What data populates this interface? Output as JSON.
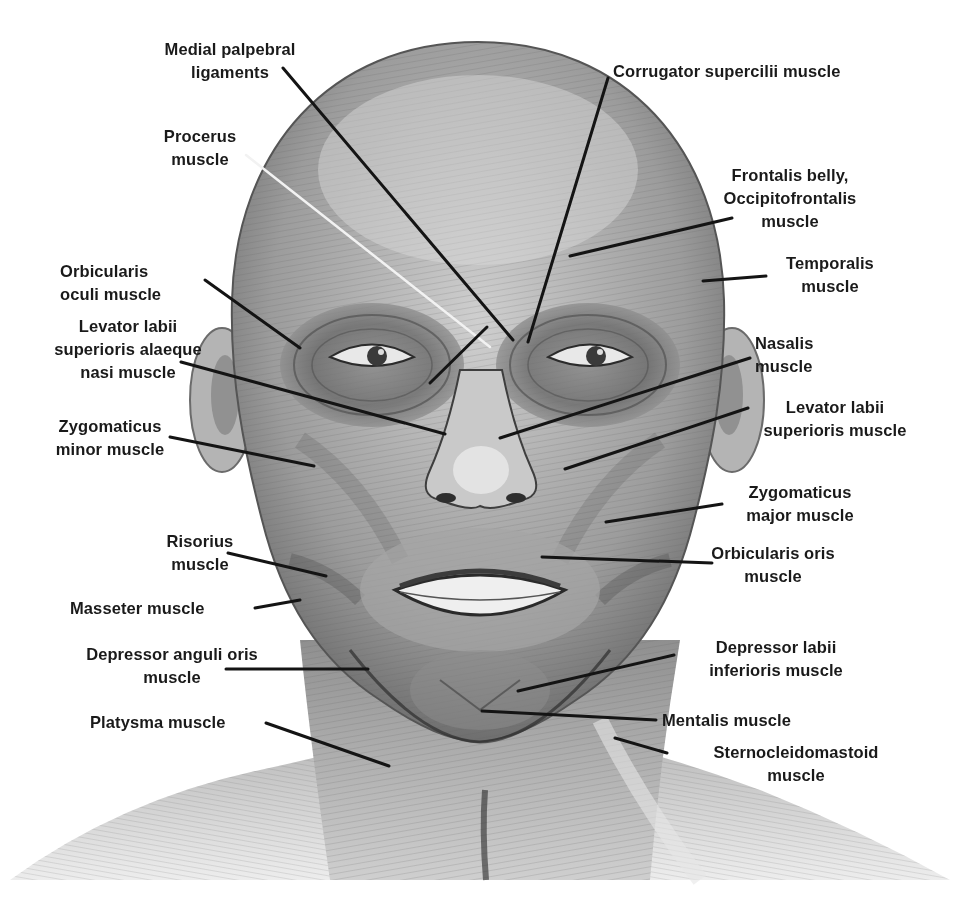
{
  "figure": {
    "colors": {
      "background": "#ffffff",
      "text": "#1a1a1a",
      "leader_line": "#141414",
      "leader_line_light": "#f2f2f2",
      "skin_mid": "#a9a9a9",
      "skin_light": "#dcdcdc",
      "skin_dark": "#555555"
    }
  },
  "labels": [
    {
      "id": "medial-palpebral-ligaments",
      "text": "Medial palpebral\nligaments",
      "x": 145,
      "y": 38,
      "w": 170,
      "align": "center"
    },
    {
      "id": "corrugator-supercilii-muscle",
      "text": "Corrugator supercilii muscle",
      "x": 613,
      "y": 60,
      "w": 320,
      "align": "right"
    },
    {
      "id": "procerus-muscle",
      "text": "Procerus\nmuscle",
      "x": 150,
      "y": 125,
      "w": 100,
      "align": "center"
    },
    {
      "id": "frontalis-belly-occipitofrontalis-muscle",
      "text": "Frontalis belly,\nOccipitofrontalis\nmuscle",
      "x": 700,
      "y": 164,
      "w": 180,
      "align": "center"
    },
    {
      "id": "temporalis-muscle",
      "text": "Temporalis\nmuscle",
      "x": 760,
      "y": 252,
      "w": 140,
      "align": "center"
    },
    {
      "id": "orbicularis-oculi-muscle",
      "text": "Orbicularis\noculi muscle",
      "x": 60,
      "y": 260,
      "w": 150,
      "align": "right"
    },
    {
      "id": "levator-labii-superioris-alaeque-nasi-muscle",
      "text": "Levator labii\nsuperioris alaeque\nnasi muscle",
      "x": 28,
      "y": 315,
      "w": 200,
      "align": "center"
    },
    {
      "id": "nasalis-muscle",
      "text": "Nasalis\nmuscle",
      "x": 755,
      "y": 332,
      "w": 100,
      "align": "right"
    },
    {
      "id": "levator-labii-superioris-muscle",
      "text": "Levator labii\nsuperioris muscle",
      "x": 735,
      "y": 396,
      "w": 200,
      "align": "center"
    },
    {
      "id": "zygomaticus-minor-muscle",
      "text": "Zygomaticus\nminor muscle",
      "x": 40,
      "y": 415,
      "w": 140,
      "align": "center"
    },
    {
      "id": "zygomaticus-major-muscle",
      "text": "Zygomaticus\nmajor muscle",
      "x": 720,
      "y": 481,
      "w": 160,
      "align": "center"
    },
    {
      "id": "risorius-muscle",
      "text": "Risorius\nmuscle",
      "x": 150,
      "y": 530,
      "w": 100,
      "align": "center"
    },
    {
      "id": "orbicularis-oris-muscle",
      "text": "Orbicularis oris\nmuscle",
      "x": 673,
      "y": 542,
      "w": 200,
      "align": "center"
    },
    {
      "id": "masseter-muscle",
      "text": "Masseter muscle",
      "x": 70,
      "y": 597,
      "w": 180,
      "align": "right"
    },
    {
      "id": "depressor-labii-inferioris-muscle",
      "text": "Depressor labii\ninferioris muscle",
      "x": 676,
      "y": 636,
      "w": 200,
      "align": "center"
    },
    {
      "id": "depressor-anguli-oris-muscle",
      "text": "Depressor anguli oris\nmuscle",
      "x": 62,
      "y": 643,
      "w": 220,
      "align": "center"
    },
    {
      "id": "platysma-muscle",
      "text": "Platysma muscle",
      "x": 90,
      "y": 711,
      "w": 176,
      "align": "right"
    },
    {
      "id": "mentalis-muscle",
      "text": "Mentalis muscle",
      "x": 662,
      "y": 709,
      "w": 180,
      "align": "right"
    },
    {
      "id": "sternocleidomastoid-muscle",
      "text": "Sternocleidomastoid\nmuscle",
      "x": 686,
      "y": 741,
      "w": 220,
      "align": "center"
    }
  ],
  "leader_lines": [
    {
      "for": "medial-palpebral-ligaments",
      "x1": 283,
      "y1": 68,
      "x2": 513,
      "y2": 340,
      "tone": "dark"
    },
    {
      "for": "corrugator-supercilii-muscle",
      "x1": 608,
      "y1": 78,
      "x2": 528,
      "y2": 342,
      "tone": "dark"
    },
    {
      "for": "procerus-muscle",
      "x1": 246,
      "y1": 155,
      "x2": 490,
      "y2": 347,
      "tone": "light"
    },
    {
      "for": "frontalis-belly-occipitofrontalis-muscle",
      "x1": 732,
      "y1": 218,
      "x2": 570,
      "y2": 256,
      "tone": "dark"
    },
    {
      "for": "temporalis-muscle",
      "x1": 766,
      "y1": 276,
      "x2": 703,
      "y2": 281,
      "tone": "dark"
    },
    {
      "for": "orbicularis-oculi-muscle",
      "x1": 205,
      "y1": 280,
      "x2": 300,
      "y2": 348,
      "tone": "dark"
    },
    {
      "for": "levator-labii-superioris-alaeque-nasi-muscle",
      "x1": 181,
      "y1": 362,
      "x2": 445,
      "y2": 434,
      "tone": "dark"
    },
    {
      "for": "medial-palpebral-ligaments-branch",
      "x1": 487,
      "y1": 327,
      "x2": 430,
      "y2": 383,
      "tone": "dark"
    },
    {
      "for": "zygomaticus-minor-muscle",
      "x1": 170,
      "y1": 437,
      "x2": 314,
      "y2": 466,
      "tone": "dark"
    },
    {
      "for": "nasalis-muscle",
      "x1": 750,
      "y1": 358,
      "x2": 500,
      "y2": 438,
      "tone": "dark"
    },
    {
      "for": "levator-labii-superioris-muscle",
      "x1": 748,
      "y1": 408,
      "x2": 565,
      "y2": 469,
      "tone": "dark"
    },
    {
      "for": "zygomaticus-major-muscle",
      "x1": 722,
      "y1": 504,
      "x2": 606,
      "y2": 522,
      "tone": "dark"
    },
    {
      "for": "orbicularis-oris-muscle",
      "x1": 712,
      "y1": 563,
      "x2": 542,
      "y2": 557,
      "tone": "dark"
    },
    {
      "for": "risorius-muscle",
      "x1": 228,
      "y1": 553,
      "x2": 326,
      "y2": 576,
      "tone": "dark"
    },
    {
      "for": "masseter-muscle",
      "x1": 255,
      "y1": 608,
      "x2": 300,
      "y2": 600,
      "tone": "dark"
    },
    {
      "for": "depressor-anguli-oris-muscle",
      "x1": 226,
      "y1": 669,
      "x2": 368,
      "y2": 669,
      "tone": "dark"
    },
    {
      "for": "platysma-muscle",
      "x1": 266,
      "y1": 723,
      "x2": 389,
      "y2": 766,
      "tone": "dark"
    },
    {
      "for": "depressor-labii-inferioris-muscle",
      "x1": 674,
      "y1": 655,
      "x2": 518,
      "y2": 691,
      "tone": "dark"
    },
    {
      "for": "mentalis-muscle",
      "x1": 656,
      "y1": 720,
      "x2": 482,
      "y2": 711,
      "tone": "dark"
    },
    {
      "for": "sternocleidomastoid-muscle",
      "x1": 615,
      "y1": 738,
      "x2": 667,
      "y2": 753,
      "tone": "dark"
    }
  ]
}
